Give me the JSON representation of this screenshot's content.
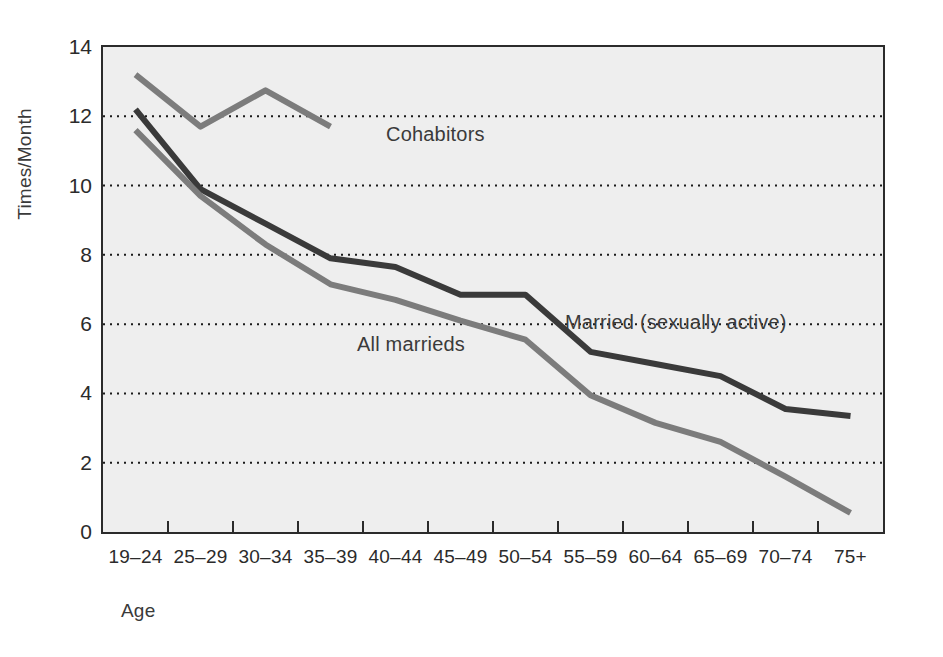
{
  "chart_data": {
    "type": "line",
    "title": "",
    "subtitle": "",
    "xlabel": "Age",
    "ylabel": "Times/Month",
    "categories": [
      "19–24",
      "25–29",
      "30–34",
      "35–39",
      "40–44",
      "45–49",
      "50–54",
      "55–59",
      "60–64",
      "65–69",
      "70–74",
      "75+"
    ],
    "ylim": [
      0,
      14
    ],
    "yticks": [
      0,
      2,
      4,
      6,
      8,
      10,
      12,
      14
    ],
    "ytick_labels": [
      "0",
      "2",
      "4",
      "6",
      "8",
      "10",
      "12",
      "14"
    ],
    "grid": "horizontal-dotted",
    "legend_position": "inline-annotations",
    "plot_background": "#eeeeee",
    "axis_color": "#2b2b2b",
    "gridline_color": "#1a1a1a",
    "series": [
      {
        "name": "Cohabitors",
        "color": "#7c7c7c",
        "values": [
          13.2,
          11.7,
          12.75,
          11.7,
          null,
          null,
          null,
          null,
          null,
          null,
          null,
          null
        ]
      },
      {
        "name": "Married (sexually active)",
        "color": "#3a3a3a",
        "values": [
          12.2,
          9.9,
          8.9,
          7.9,
          7.65,
          6.85,
          6.85,
          5.2,
          4.85,
          4.5,
          3.55,
          3.35
        ]
      },
      {
        "name": "All marrieds",
        "color": "#7c7c7c",
        "values": [
          11.6,
          9.7,
          8.3,
          7.15,
          6.7,
          6.1,
          5.55,
          3.95,
          3.15,
          2.6,
          1.6,
          0.55
        ]
      }
    ],
    "annotations": [
      {
        "id": "cohabitors",
        "text": "Cohabitors"
      },
      {
        "id": "married_active",
        "text": "Married (sexually active)"
      },
      {
        "id": "all_marrieds",
        "text": "All marrieds"
      }
    ]
  }
}
